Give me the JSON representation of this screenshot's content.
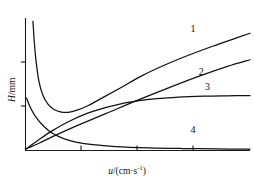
{
  "chart_data": {
    "type": "line",
    "title": "",
    "xlabel": "u/(cm·s⁻¹)",
    "ylabel": "H/mm",
    "xlabel_parts": {
      "var": "u",
      "unit": "/(cm·s",
      "exponent": "-1",
      "close": ")"
    },
    "ylabel_parts": {
      "var": "H",
      "unit": "/mm"
    },
    "grid": false,
    "legend": "inline-curve-numbers",
    "xlim": [
      0,
      10
    ],
    "ylim": [
      0,
      10
    ],
    "axis_ticks": {
      "x": [
        2.5,
        5.0,
        7.5
      ],
      "y": [
        3.5,
        6.8
      ]
    },
    "series": [
      {
        "name": "1",
        "label": "1",
        "label_x": 7.35,
        "label_y": 8.95,
        "description": "van Deemter curve with sharp minimum then linear rise",
        "x": [
          0.33,
          0.36,
          0.4,
          0.48,
          0.6,
          0.78,
          1.0,
          1.25,
          1.55,
          1.9,
          2.3,
          2.8,
          3.4,
          4.2,
          5.2,
          6.2,
          7.2,
          8.3,
          9.4,
          10.0
        ],
        "y": [
          9.75,
          9.0,
          8.0,
          6.6,
          5.2,
          4.15,
          3.5,
          3.12,
          2.92,
          2.88,
          3.05,
          3.4,
          3.95,
          4.7,
          5.65,
          6.45,
          7.15,
          7.85,
          8.5,
          8.85
        ]
      },
      {
        "name": "2",
        "label": "2",
        "label_x": 7.72,
        "label_y": 5.7,
        "description": "monotonically rising near-linear curve",
        "x": [
          0.0,
          0.6,
          1.4,
          2.4,
          3.6,
          5.0,
          6.4,
          7.8,
          9.0,
          10.0
        ],
        "y": [
          0.1,
          0.55,
          1.2,
          1.95,
          2.8,
          3.8,
          4.75,
          5.65,
          6.35,
          6.85
        ]
      },
      {
        "name": "3",
        "label": "3",
        "label_x": 8.0,
        "label_y": 4.58,
        "description": "rising curve that plateaus",
        "x": [
          0.0,
          0.5,
          1.2,
          2.0,
          3.0,
          4.2,
          5.5,
          6.8,
          8.0,
          9.0,
          10.0
        ],
        "y": [
          0.1,
          0.7,
          1.5,
          2.25,
          2.95,
          3.5,
          3.85,
          4.02,
          4.1,
          4.13,
          4.15
        ]
      },
      {
        "name": "4",
        "label": "4",
        "label_x": 7.35,
        "label_y": 1.3,
        "description": "steeply decaying curve flattening to near zero",
        "x": [
          0.05,
          0.2,
          0.45,
          0.8,
          1.2,
          1.7,
          2.3,
          3.0,
          4.0,
          5.5,
          7.0,
          8.5,
          10.0
        ],
        "y": [
          3.95,
          3.3,
          2.55,
          1.85,
          1.3,
          0.9,
          0.62,
          0.44,
          0.3,
          0.2,
          0.15,
          0.12,
          0.1
        ]
      }
    ]
  },
  "axes": {
    "x_axis_name": "horizontal-velocity-axis",
    "y_axis_name": "vertical-plate-height-axis"
  }
}
